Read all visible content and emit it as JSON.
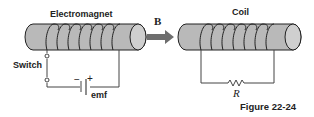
{
  "figure": {
    "caption": "Figure 22-24"
  },
  "left": {
    "title": "Electromagnet",
    "switch_label": "Switch",
    "emf_label": "emf",
    "minus": "−",
    "plus": "+"
  },
  "arrow": {
    "label": "B"
  },
  "right": {
    "title": "Coil",
    "resistor_label": "R"
  },
  "colors": {
    "cylinder": "#b9b9b9",
    "stroke": "#222222",
    "arrow": "#6e6e6e"
  }
}
